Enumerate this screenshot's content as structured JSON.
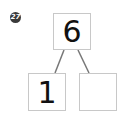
{
  "problem": {
    "number": "27",
    "whole": "6",
    "parts": [
      {
        "value": "1"
      },
      {
        "value": ""
      }
    ]
  },
  "colors": {
    "box_border": "#c8c8c8",
    "line": "#777777",
    "badge": "#3a3a3a"
  }
}
